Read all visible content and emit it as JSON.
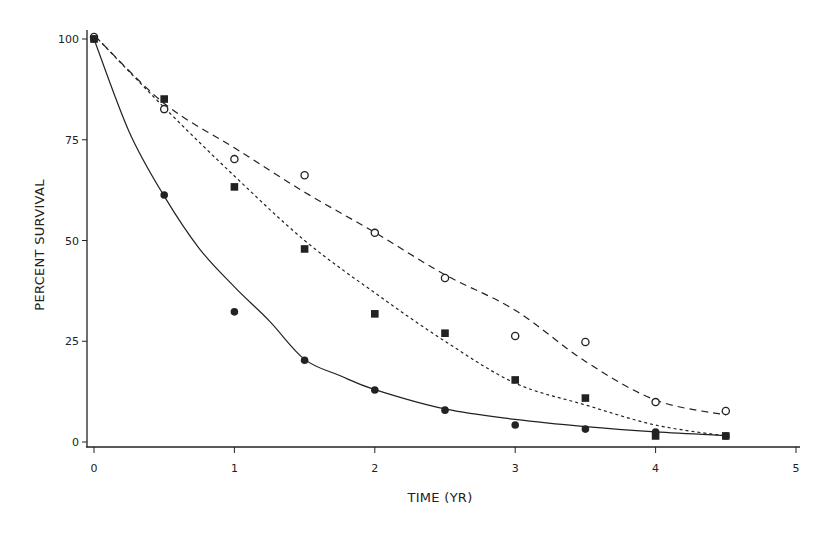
{
  "chart_data": {
    "type": "scatter",
    "title": "",
    "xlabel": "TIME (YR)",
    "ylabel": "PERCENT SURVIVAL",
    "xlim": [
      0,
      5
    ],
    "ylim": [
      0,
      100
    ],
    "xticks": [
      0,
      1,
      2,
      3,
      4,
      5
    ],
    "yticks": [
      0,
      25,
      50,
      75,
      100
    ],
    "grid": false,
    "legend": null,
    "series": [
      {
        "name": "open-circles",
        "marker": "open-circle",
        "line_style": "dashed",
        "points": [
          [
            0,
            100.5
          ],
          [
            0.5,
            82.6
          ],
          [
            1,
            70.2
          ],
          [
            1.5,
            66.2
          ],
          [
            2,
            51.9
          ],
          [
            2.5,
            40.7
          ],
          [
            3,
            26.3
          ],
          [
            3.5,
            24.8
          ],
          [
            4,
            9.9
          ],
          [
            4.5,
            7.7
          ]
        ],
        "fit": [
          [
            0,
            101
          ],
          [
            0.5,
            84
          ],
          [
            1,
            73
          ],
          [
            1.5,
            62
          ],
          [
            2,
            52
          ],
          [
            2.5,
            41.5
          ],
          [
            3,
            32.7
          ],
          [
            3.5,
            20
          ],
          [
            4,
            10.4
          ],
          [
            4.5,
            6.7
          ]
        ]
      },
      {
        "name": "filled-squares",
        "marker": "filled-square",
        "line_style": "dotted",
        "points": [
          [
            0,
            100
          ],
          [
            0.5,
            85.1
          ],
          [
            1,
            63.3
          ],
          [
            1.5,
            47.9
          ],
          [
            2,
            31.8
          ],
          [
            2.5,
            27.0
          ],
          [
            3,
            15.4
          ],
          [
            3.5,
            10.9
          ],
          [
            4,
            1.5
          ],
          [
            4.5,
            1.5
          ]
        ],
        "fit": [
          [
            0,
            101
          ],
          [
            0.5,
            83
          ],
          [
            1,
            66
          ],
          [
            1.5,
            50
          ],
          [
            2,
            37
          ],
          [
            2.5,
            25
          ],
          [
            3,
            14.6
          ],
          [
            3.5,
            9.2
          ],
          [
            4,
            4.2
          ],
          [
            4.5,
            1.5
          ]
        ]
      },
      {
        "name": "filled-circles",
        "marker": "filled-circle",
        "line_style": "solid",
        "points": [
          [
            0,
            100
          ],
          [
            0.5,
            61.3
          ],
          [
            1,
            32.3
          ],
          [
            1.5,
            20.3
          ],
          [
            2,
            12.9
          ],
          [
            2.5,
            7.9
          ],
          [
            3,
            4.2
          ],
          [
            3.5,
            3.2
          ],
          [
            4,
            2.5
          ],
          [
            4.5,
            1.5
          ]
        ],
        "fit": [
          [
            0,
            100
          ],
          [
            0.25,
            77
          ],
          [
            0.5,
            61
          ],
          [
            0.75,
            48
          ],
          [
            1,
            38.5
          ],
          [
            1.25,
            30
          ],
          [
            1.5,
            20.5
          ],
          [
            1.75,
            16.5
          ],
          [
            2,
            13
          ],
          [
            2.5,
            8.2
          ],
          [
            3,
            5.6
          ],
          [
            3.5,
            3.8
          ],
          [
            4,
            2.5
          ],
          [
            4.5,
            1.6
          ]
        ]
      }
    ]
  },
  "axes": {
    "xlabel": "TIME (YR)",
    "ylabel": "PERCENT SURVIVAL",
    "xtick_labels": [
      "0",
      "1",
      "2",
      "3",
      "4",
      "5"
    ],
    "ytick_labels": [
      "0",
      "25",
      "50",
      "75",
      "100"
    ]
  },
  "colors": {
    "ink": "#222222",
    "background": "#ffffff"
  }
}
